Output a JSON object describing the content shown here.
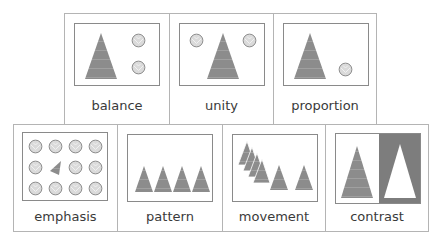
{
  "colors": {
    "triangle_fill": "#8c8c8c",
    "triangle_stripe": "#a6a6a6",
    "circle_fill": "#d9d9d9",
    "circle_stroke": "#8a8a8a",
    "contrast_dark": "#7a7a7a",
    "card_border": "#b4b4b4",
    "frame_border": "#8a8a8a"
  },
  "cards": {
    "balance": {
      "label": "balance"
    },
    "unity": {
      "label": "unity"
    },
    "proportion": {
      "label": "proportion"
    },
    "emphasis": {
      "label": "emphasis"
    },
    "pattern": {
      "label": "pattern"
    },
    "movement": {
      "label": "movement"
    },
    "contrast": {
      "label": "contrast"
    }
  }
}
